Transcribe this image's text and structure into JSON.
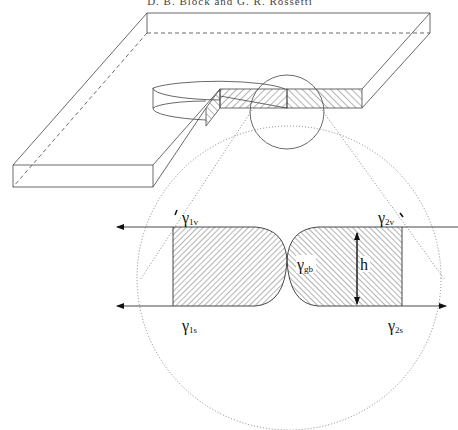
{
  "caption": {
    "text": "D. B. Block and G. R. Rossetti"
  },
  "figure": {
    "type": "diagram",
    "labels": {
      "gamma_1v": {
        "symbol": "γ",
        "subscript": "1v"
      },
      "gamma_2v": {
        "symbol": "γ",
        "subscript": "2v"
      },
      "gamma_gb": {
        "symbol": "γ",
        "subscript": "gb"
      },
      "gamma_1s": {
        "symbol": "γ",
        "subscript": "1s"
      },
      "gamma_2s": {
        "symbol": "γ",
        "subscript": "2s"
      },
      "height": "h"
    },
    "colors": {
      "stroke": "#333333",
      "dotted": "#777777",
      "hatch": "#444444",
      "background": "#ffffff"
    }
  }
}
